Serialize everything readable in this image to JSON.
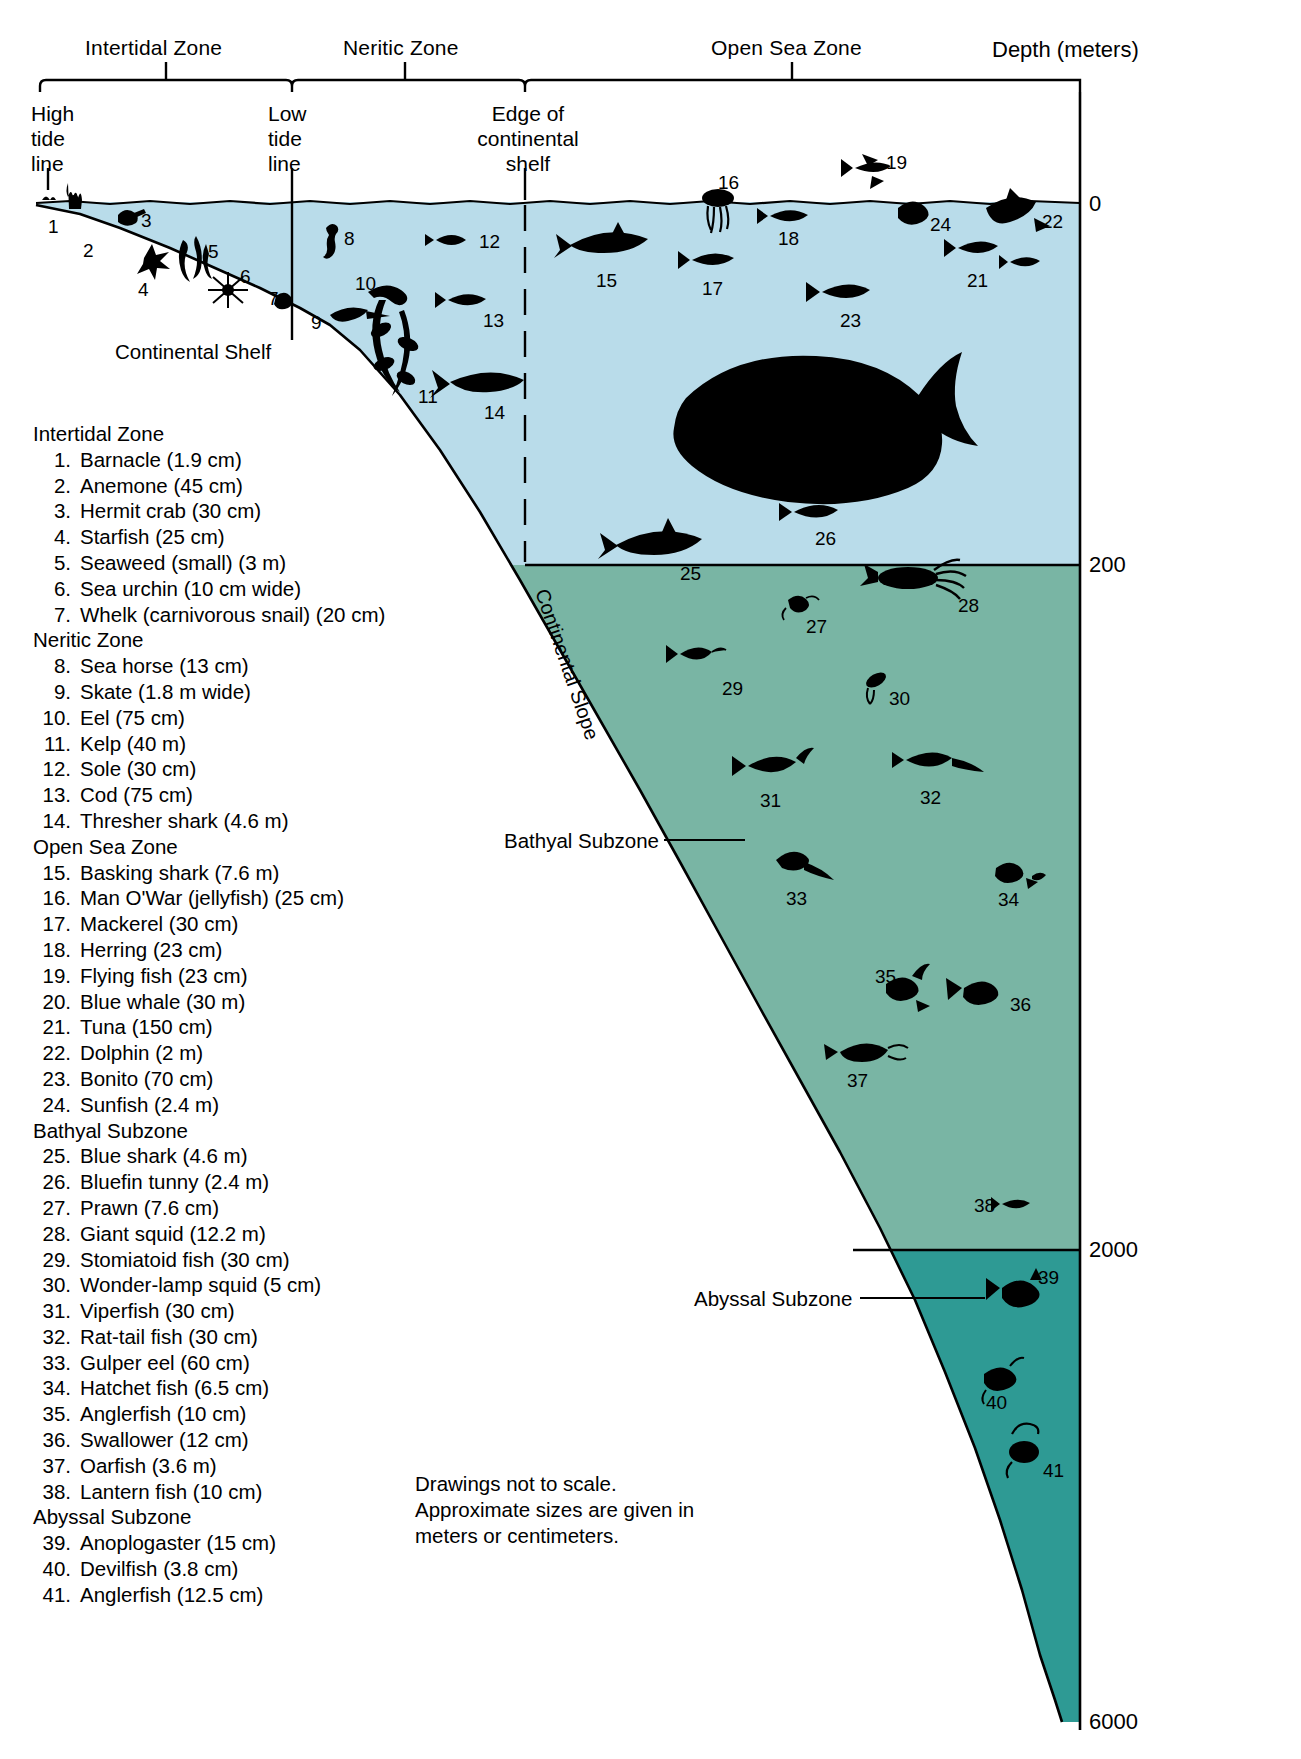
{
  "header": {
    "zones": [
      {
        "name": "zone-intertidal",
        "label": "Intertidal Zone"
      },
      {
        "name": "zone-neritic",
        "label": "Neritic Zone"
      },
      {
        "name": "zone-opensea",
        "label": "Open Sea Zone"
      }
    ],
    "depth_axis_label": "Depth (meters)",
    "boundaries": [
      {
        "name": "high-tide",
        "lines": [
          "High",
          "tide",
          "line"
        ]
      },
      {
        "name": "low-tide",
        "lines": [
          "Low",
          "tide",
          "line"
        ]
      },
      {
        "name": "shelf-edge",
        "lines": [
          "Edge of",
          "continental",
          "shelf"
        ]
      }
    ]
  },
  "depth_ticks": [
    "0",
    "200",
    "2000",
    "6000"
  ],
  "diagram_labels": {
    "continental_shelf": "Continental Shelf",
    "continental_slope": "Continental Slope",
    "bathyal_subzone": "Bathyal Subzone",
    "abyssal_subzone": "Abyssal Subzone"
  },
  "colors": {
    "surface_water": "#b9dcea",
    "bathyal_water": "#79b5a4",
    "abyssal_water": "#2e9a94",
    "outline": "#000000",
    "page": "#ffffff"
  },
  "callout_numbers": [
    "1",
    "2",
    "3",
    "4",
    "5",
    "6",
    "7",
    "8",
    "9",
    "10",
    "11",
    "12",
    "13",
    "14",
    "15",
    "16",
    "17",
    "18",
    "19",
    "20",
    "21",
    "22",
    "23",
    "24",
    "25",
    "26",
    "27",
    "28",
    "29",
    "30",
    "31",
    "32",
    "33",
    "34",
    "35",
    "36",
    "37",
    "38",
    "39",
    "40",
    "41"
  ],
  "legend": {
    "groups": [
      {
        "name": "group-intertidal",
        "heading": "Intertidal Zone",
        "items": [
          {
            "n": "1.",
            "text": "Barnacle (1.9 cm)"
          },
          {
            "n": "2.",
            "text": "Anemone (45 cm)"
          },
          {
            "n": "3.",
            "text": "Hermit crab (30 cm)"
          },
          {
            "n": "4.",
            "text": "Starfish (25 cm)"
          },
          {
            "n": "5.",
            "text": "Seaweed (small) (3 m)"
          },
          {
            "n": "6.",
            "text": "Sea urchin (10 cm wide)"
          },
          {
            "n": "7.",
            "text": "Whelk (carnivorous snail) (20 cm)"
          }
        ]
      },
      {
        "name": "group-neritic",
        "heading": "Neritic Zone",
        "items": [
          {
            "n": "8.",
            "text": "Sea  horse (13 cm)"
          },
          {
            "n": "9.",
            "text": "Skate (1.8 m wide)"
          },
          {
            "n": "10.",
            "text": "Eel (75 cm)"
          },
          {
            "n": "11.",
            "text": "Kelp (40 m)"
          },
          {
            "n": "12.",
            "text": "Sole (30 cm)"
          },
          {
            "n": "13.",
            "text": "Cod (75 cm)"
          },
          {
            "n": "14.",
            "text": "Thresher shark (4.6 m)"
          }
        ]
      },
      {
        "name": "group-opensea",
        "heading": "Open Sea Zone",
        "items": [
          {
            "n": "15.",
            "text": "Basking shark (7.6 m)"
          },
          {
            "n": "16.",
            "text": "Man O'War (jellyfish) (25 cm)"
          },
          {
            "n": "17.",
            "text": "Mackerel (30 cm)"
          },
          {
            "n": "18.",
            "text": "Herring (23 cm)"
          },
          {
            "n": "19.",
            "text": "Flying fish (23 cm)"
          },
          {
            "n": "20.",
            "text": "Blue whale (30 m)"
          },
          {
            "n": "21.",
            "text": "Tuna (150 cm)"
          },
          {
            "n": "22.",
            "text": "Dolphin (2 m)"
          },
          {
            "n": "23.",
            "text": "Bonito (70 cm)"
          },
          {
            "n": "24.",
            "text": "Sunfish (2.4 m)"
          }
        ]
      },
      {
        "name": "group-bathyal",
        "heading": "Bathyal Subzone",
        "items": [
          {
            "n": "25.",
            "text": "Blue shark (4.6 m)"
          },
          {
            "n": "26.",
            "text": "Bluefin tunny (2.4 m)"
          },
          {
            "n": "27.",
            "text": "Prawn (7.6 cm)"
          },
          {
            "n": "28.",
            "text": "Giant  squid (12.2 m)"
          },
          {
            "n": "29.",
            "text": "Stomiatoid fish (30 cm)"
          },
          {
            "n": "30.",
            "text": "Wonder-lamp squid (5 cm)"
          },
          {
            "n": "31.",
            "text": "Viperfish (30 cm)"
          },
          {
            "n": "32.",
            "text": "Rat-tail fish (30 cm)"
          },
          {
            "n": "33.",
            "text": "Gulper eel (60 cm)"
          },
          {
            "n": "34.",
            "text": "Hatchet fish (6.5 cm)"
          },
          {
            "n": "35.",
            "text": "Anglerfish (10 cm)"
          },
          {
            "n": "36.",
            "text": "Swallower (12 cm)"
          },
          {
            "n": "37.",
            "text": "Oarfish (3.6 m)"
          },
          {
            "n": "38.",
            "text": "Lantern fish (10 cm)"
          }
        ]
      },
      {
        "name": "group-abyssal",
        "heading": "Abyssal Subzone",
        "items": [
          {
            "n": "39.",
            "text": "Anoplogaster (15 cm)"
          },
          {
            "n": "40.",
            "text": "Devilfish (3.8 cm)"
          },
          {
            "n": "41.",
            "text": "Anglerfish (12.5 cm)"
          }
        ]
      }
    ]
  },
  "footnote": {
    "line1": "Drawings not to scale.",
    "line2": "Approximate sizes are given in",
    "line3": "meters or centimeters."
  }
}
